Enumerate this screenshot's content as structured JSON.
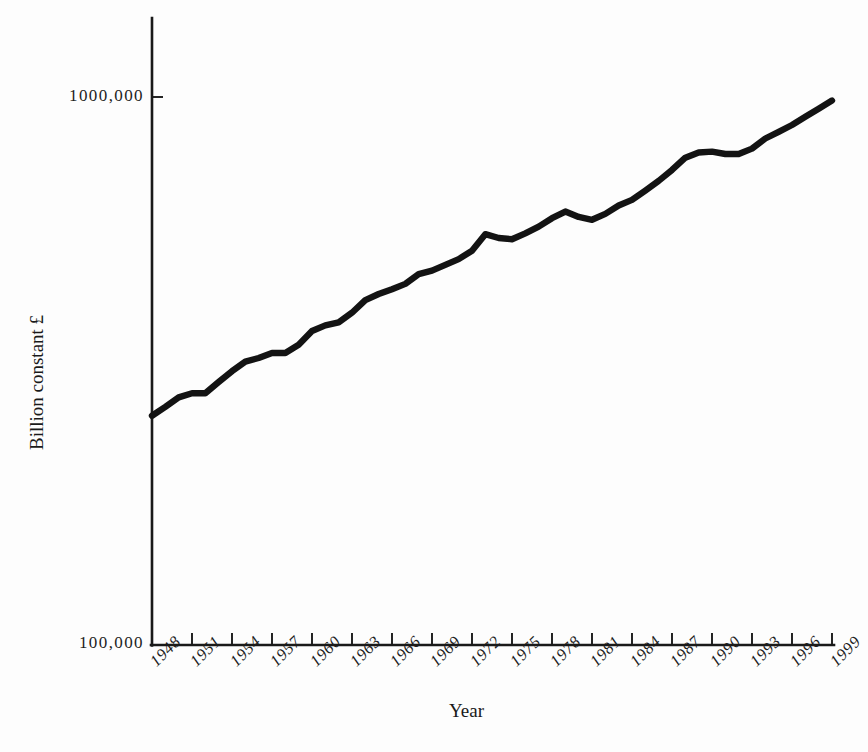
{
  "chart_data": {
    "type": "line",
    "title": "",
    "subtitle": "",
    "xlabel": "Year",
    "ylabel": "Billion constant £",
    "yscale": "log",
    "ylim": [
      100000,
      1300000
    ],
    "xlim": [
      1948,
      2000
    ],
    "grid": false,
    "legend": null,
    "y_tick_labels": [
      "1000,000",
      "100,000"
    ],
    "y_tick_values": [
      1000000,
      100000
    ],
    "x_tick_labels": [
      "1948",
      "1951",
      "1954",
      "1957",
      "1960",
      "1963",
      "1966",
      "1969",
      "1972",
      "1975",
      "1978",
      "1981",
      "1984",
      "1987",
      "1990",
      "1993",
      "1996",
      "1999"
    ],
    "x_tick_values": [
      1948,
      1951,
      1954,
      1957,
      1960,
      1963,
      1966,
      1969,
      1972,
      1975,
      1978,
      1981,
      1984,
      1987,
      1990,
      1993,
      1996,
      1999
    ],
    "series": [
      {
        "name": "UK GDP",
        "color": "#131313",
        "x": [
          1948,
          1949,
          1950,
          1951,
          1952,
          1953,
          1954,
          1955,
          1956,
          1957,
          1958,
          1959,
          1960,
          1961,
          1962,
          1963,
          1964,
          1965,
          1966,
          1967,
          1968,
          1969,
          1970,
          1971,
          1972,
          1973,
          1974,
          1975,
          1976,
          1977,
          1978,
          1979,
          1980,
          1981,
          1982,
          1983,
          1984,
          1985,
          1986,
          1987,
          1988,
          1989,
          1990,
          1991,
          1992,
          1993,
          1994,
          1995,
          1996,
          1997,
          1998,
          1999
        ],
        "values": [
          262000,
          272000,
          283000,
          288000,
          288000,
          302000,
          316000,
          329000,
          334000,
          341000,
          341000,
          353000,
          374000,
          383000,
          388000,
          404000,
          426000,
          437000,
          446000,
          456000,
          475000,
          482000,
          494000,
          506000,
          524000,
          562000,
          553000,
          550000,
          564000,
          580000,
          601000,
          618000,
          604000,
          597000,
          612000,
          634000,
          649000,
          675000,
          703000,
          736000,
          775000,
          792000,
          795000,
          787000,
          787000,
          805000,
          840000,
          864000,
          889000,
          920000,
          952000,
          985000
        ]
      }
    ],
    "annotations": []
  },
  "axis": {
    "y_labels": [
      {
        "text": "1000,000",
        "id": "y-tick-upper"
      },
      {
        "text": "100,000",
        "id": "y-tick-lower"
      }
    ],
    "x_title": "Year",
    "y_title": "Billion constant £"
  }
}
